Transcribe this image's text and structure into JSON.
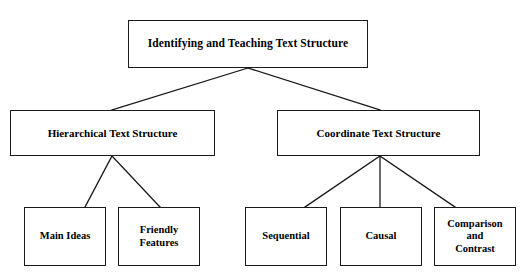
{
  "diagram": {
    "title": "Identifying and Teaching Text Structure",
    "type": "hierarchy-tree",
    "background_color": "#ffffff",
    "line_color": "#1a1a1a",
    "text_color": "#000000",
    "nodes": {
      "root": {
        "label": "Identifying and Teaching Text Structure"
      },
      "branch_left": {
        "label": "Hierarchical Text Structure"
      },
      "branch_right": {
        "label": "Coordinate Text Structure"
      },
      "leaves": {
        "main_ideas": {
          "label": "Main Ideas"
        },
        "friendly_features": {
          "label": "Friendly\nFeatures"
        },
        "sequential": {
          "label": "Sequential"
        },
        "causal": {
          "label": "Causal"
        },
        "comparison_contrast": {
          "label": "Comparison\nand\nContrast"
        }
      }
    }
  }
}
